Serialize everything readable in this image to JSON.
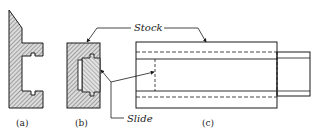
{
  "figure": {
    "labels": {
      "stock": "Stock",
      "slide": "Slide"
    },
    "captions": {
      "a": "(a)",
      "b": "(b)",
      "c": "(c)"
    }
  },
  "colors": {
    "ink": "#1a1a1a",
    "hatch_bg": "#d9d9d9",
    "background": "#ffffff"
  }
}
